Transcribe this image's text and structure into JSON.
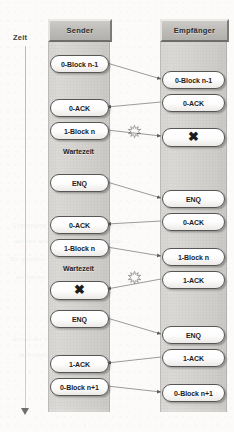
{
  "diagram": {
    "time_axis": {
      "label": "Zeit",
      "direction": "down",
      "arrow_icon": "arrow-down-icon"
    },
    "colors": {
      "lane_fill": "#d6d4d1",
      "header_fill": "#bfbdb9",
      "pill_fill": "#ffffff",
      "pill_border": "#585654",
      "arrow": "#6f6d6a",
      "text": "#1c1c1c",
      "page": "#fcfbfa"
    },
    "lanes": [
      {
        "id": "sender",
        "header": "Sender"
      },
      {
        "id": "empfaenger",
        "header": "Empfänger"
      }
    ],
    "sender_events": [
      {
        "label": "0-Block n-1",
        "type": "message",
        "y": 55
      },
      {
        "label": "0-ACK",
        "type": "message",
        "y": 99
      },
      {
        "label": "1-Block n",
        "type": "message",
        "y": 122
      },
      {
        "label": "Wartezeit",
        "type": "caption",
        "y": 148
      },
      {
        "label": "ENQ",
        "type": "message",
        "y": 174
      },
      {
        "label": "0-ACK",
        "type": "message",
        "y": 216
      },
      {
        "label": "1-Block n",
        "type": "message",
        "y": 239
      },
      {
        "label": "Wartezeit",
        "type": "caption",
        "y": 265
      },
      {
        "label": "✖",
        "type": "corrupt",
        "y": 281
      },
      {
        "label": "ENQ",
        "type": "message",
        "y": 310
      },
      {
        "label": "1-ACK",
        "type": "message",
        "y": 355
      },
      {
        "label": "0-Block n+1",
        "type": "message",
        "y": 378
      }
    ],
    "receiver_events": [
      {
        "label": "0-Block n-1",
        "type": "message",
        "y": 71
      },
      {
        "label": "0-ACK",
        "type": "message",
        "y": 94
      },
      {
        "label": "✖",
        "type": "corrupt",
        "y": 128
      },
      {
        "label": "ENQ",
        "type": "message",
        "y": 190
      },
      {
        "label": "0-ACK",
        "type": "message",
        "y": 213
      },
      {
        "label": "1-Block n",
        "type": "message",
        "y": 248
      },
      {
        "label": "1-ACK",
        "type": "message",
        "y": 271
      },
      {
        "label": "ENQ",
        "type": "message",
        "y": 326
      },
      {
        "label": "1-ACK",
        "type": "message",
        "y": 349
      },
      {
        "label": "0-Block n+1",
        "type": "message",
        "y": 384
      }
    ],
    "transfers": [
      {
        "from": "sender",
        "to": "empfaenger",
        "y1": 63,
        "y2": 79,
        "error": false
      },
      {
        "from": "empfaenger",
        "to": "sender",
        "y1": 102,
        "y2": 107,
        "error": false
      },
      {
        "from": "sender",
        "to": "empfaenger",
        "y1": 130,
        "y2": 136,
        "error": true
      },
      {
        "from": "sender",
        "to": "empfaenger",
        "y1": 182,
        "y2": 198,
        "error": false
      },
      {
        "from": "empfaenger",
        "to": "sender",
        "y1": 221,
        "y2": 224,
        "error": false
      },
      {
        "from": "sender",
        "to": "empfaenger",
        "y1": 247,
        "y2": 256,
        "error": false
      },
      {
        "from": "empfaenger",
        "to": "sender",
        "y1": 279,
        "y2": 289,
        "error": true
      },
      {
        "from": "sender",
        "to": "empfaenger",
        "y1": 318,
        "y2": 334,
        "error": false
      },
      {
        "from": "empfaenger",
        "to": "sender",
        "y1": 357,
        "y2": 363,
        "error": false
      },
      {
        "from": "sender",
        "to": "empfaenger",
        "y1": 386,
        "y2": 392,
        "error": false
      }
    ],
    "error_markers": [
      {
        "name": "burst-1",
        "x": 128,
        "y": 124,
        "icon": "error-burst-icon"
      },
      {
        "name": "burst-2",
        "x": 128,
        "y": 270,
        "icon": "error-burst-icon"
      }
    ]
  }
}
